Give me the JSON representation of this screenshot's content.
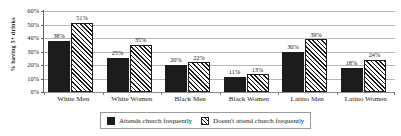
{
  "chart_data": {
    "type": "bar",
    "title": "",
    "subtitle": "",
    "xlabel": "",
    "ylabel": "% having 5+ drinks",
    "ylim": [
      0,
      60
    ],
    "ytick_labels": [
      "0%",
      "10%",
      "20%",
      "30%",
      "40%",
      "50%",
      "60%"
    ],
    "ytick_values": [
      0,
      10,
      20,
      30,
      40,
      50,
      60
    ],
    "grid": true,
    "legend_position": "bottom",
    "categories": [
      "White Men",
      "White Women",
      "Black Men",
      "Black Women",
      "Latino Men",
      "Latino Women"
    ],
    "series": [
      {
        "name": "Attends church frequently",
        "pattern": "solid",
        "color": "#1c1c1c",
        "values": [
          38,
          25,
          20,
          11,
          30,
          18
        ],
        "value_labels": [
          "38%",
          "25%",
          "20%",
          "11%",
          "30%",
          "18%"
        ]
      },
      {
        "name": "Doesn't attend church frequently",
        "pattern": "diagonal-hatch",
        "color": "#1c1c1c",
        "values": [
          51,
          35,
          22,
          13,
          39,
          24
        ],
        "value_labels": [
          "51%",
          "35%",
          "22%",
          "13%",
          "39%",
          "24%"
        ]
      }
    ]
  },
  "legend": {
    "entries": [
      {
        "label": "Attends church frequently"
      },
      {
        "label": "Doesn't attend church frequently"
      }
    ]
  }
}
